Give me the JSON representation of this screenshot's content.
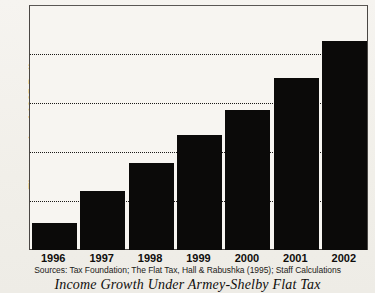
{
  "chart_data": {
    "type": "bar",
    "title": "Income Growth Under Armey-Shelby Flat Tax",
    "subtitle": "",
    "xlabel": "",
    "ylabel": "Thousands of 1995 Dollars",
    "categories": [
      "1996",
      "1997",
      "1998",
      "1999",
      "2000",
      "2001",
      "2002"
    ],
    "values": [
      0.55,
      1.2,
      1.78,
      2.35,
      2.87,
      3.53,
      4.28
    ],
    "series": [
      {
        "name": "Income",
        "values": [
          0.55,
          1.2,
          1.78,
          2.35,
          2.87,
          3.53,
          4.28
        ]
      }
    ],
    "ylim": [
      0,
      5
    ],
    "yticks": [
      "0",
      "1",
      "2",
      "3",
      "4",
      "5"
    ],
    "ytick_values": [
      0,
      1,
      2,
      3,
      4,
      5
    ],
    "grid": "horizontal-dotted",
    "legend": "none",
    "bar_color": "#0b0a09",
    "background_color": "#f4f2ee",
    "source_note": "Sources: Tax Foundation; The Flat Tax, Hall & Rabushka (1995); Staff Calculations"
  }
}
